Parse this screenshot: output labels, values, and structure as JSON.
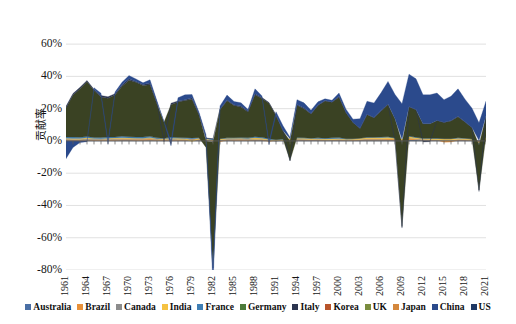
{
  "chart_data": {
    "type": "area",
    "stacked": true,
    "title": "",
    "subtitle": "",
    "xlabel": "",
    "ylabel": "贡献率",
    "ylim": [
      -80,
      70
    ],
    "ytick_labels": [
      "60%",
      "40%",
      "20%",
      "0%",
      "-20%",
      "-40%",
      "-60%",
      "-80%"
    ],
    "ytick_values": [
      60,
      40,
      20,
      0,
      -20,
      -40,
      -60,
      -80
    ],
    "xlim": [
      1961,
      2021
    ],
    "xtick_labels": [
      "1961",
      "1964",
      "1967",
      "1970",
      "1973",
      "1976",
      "1979",
      "1982",
      "1985",
      "1988",
      "1991",
      "1994",
      "1997",
      "2000",
      "2003",
      "2006",
      "2009",
      "2012",
      "2015",
      "2018",
      "2021"
    ],
    "xtick_values": [
      1961,
      1964,
      1967,
      1970,
      1973,
      1976,
      1979,
      1982,
      1985,
      1988,
      1991,
      1994,
      1997,
      2000,
      2003,
      2006,
      2009,
      2012,
      2015,
      2018,
      2021
    ],
    "grid": true,
    "grid_axis": "y",
    "legend_position": "bottom",
    "x": [
      1961,
      1962,
      1963,
      1964,
      1965,
      1966,
      1967,
      1968,
      1969,
      1970,
      1971,
      1972,
      1973,
      1974,
      1975,
      1976,
      1977,
      1978,
      1979,
      1980,
      1981,
      1982,
      1983,
      1984,
      1985,
      1986,
      1987,
      1988,
      1989,
      1990,
      1991,
      1992,
      1993,
      1994,
      1995,
      1996,
      1997,
      1998,
      1999,
      2000,
      2001,
      2002,
      2003,
      2004,
      2005,
      2006,
      2007,
      2008,
      2009,
      2010,
      2011,
      2012,
      2013,
      2014,
      2015,
      2016,
      2017,
      2018,
      2019,
      2020,
      2021
    ],
    "series": [
      {
        "name": "Australia",
        "color": "#4a6fa5",
        "values": [
          0.4,
          0.3,
          0.3,
          0.4,
          0.3,
          0.3,
          0.3,
          0.3,
          0.4,
          0.4,
          0.3,
          0.3,
          0.4,
          0.3,
          0.2,
          0.3,
          0.3,
          0.3,
          0.4,
          0.4,
          0.5,
          0.3,
          0.3,
          0.4,
          0.3,
          0.3,
          0.3,
          0.4,
          0.4,
          0.3,
          0.2,
          0.3,
          0.3,
          0.4,
          0.4,
          0.4,
          0.4,
          0.3,
          0.3,
          0.4,
          0.3,
          0.3,
          0.4,
          0.4,
          0.5,
          0.5,
          0.5,
          0.5,
          0.3,
          0.6,
          0.6,
          0.5,
          0.4,
          0.4,
          0.3,
          0.3,
          0.4,
          0.4,
          0.3,
          0.2,
          0.4
        ]
      },
      {
        "name": "Brazil",
        "color": "#e8913a",
        "values": [
          0.5,
          0.4,
          0.3,
          0.4,
          0.4,
          0.4,
          0.4,
          0.6,
          0.6,
          0.6,
          0.7,
          0.8,
          0.8,
          0.6,
          0.5,
          0.6,
          0.5,
          0.5,
          0.6,
          0.6,
          0.2,
          -0.3,
          -0.5,
          0.3,
          0.6,
          0.7,
          0.5,
          0.3,
          0.4,
          -0.4,
          0.2,
          0.1,
          0.4,
          0.5,
          0.4,
          0.3,
          0.3,
          0.1,
          0.1,
          0.3,
          0.2,
          0.3,
          0.3,
          0.6,
          0.5,
          0.5,
          0.7,
          0.7,
          -0.2,
          0.9,
          0.5,
          0.3,
          0.3,
          0.1,
          -0.8,
          -0.7,
          0.3,
          0.3,
          0.2,
          -0.6,
          0.7
        ]
      },
      {
        "name": "Canada",
        "color": "#8c8c8c",
        "values": [
          0.3,
          0.4,
          0.4,
          0.5,
          0.5,
          0.5,
          0.4,
          0.5,
          0.5,
          0.3,
          0.4,
          0.4,
          0.5,
          0.3,
          0.2,
          0.4,
          0.3,
          0.3,
          0.3,
          0.2,
          0.3,
          -0.5,
          0.3,
          0.5,
          0.4,
          0.3,
          0.4,
          0.4,
          0.3,
          0.1,
          -0.2,
          0.1,
          0.2,
          0.3,
          0.3,
          0.2,
          0.4,
          0.3,
          0.4,
          0.4,
          0.2,
          0.3,
          0.2,
          0.3,
          0.3,
          0.3,
          0.2,
          0.1,
          -0.4,
          0.3,
          0.3,
          0.2,
          0.2,
          0.2,
          0.1,
          0.1,
          0.3,
          0.2,
          0.1,
          -0.5,
          0.4
        ]
      },
      {
        "name": "India",
        "color": "#f5c242",
        "values": [
          0.5,
          0.4,
          0.5,
          0.6,
          0.3,
          0.2,
          0.6,
          0.4,
          0.5,
          0.5,
          0.3,
          0.2,
          0.4,
          0.2,
          0.6,
          0.4,
          0.5,
          0.4,
          -0.4,
          0.5,
          0.4,
          0.3,
          0.6,
          0.4,
          0.4,
          0.4,
          0.3,
          0.8,
          0.6,
          0.5,
          0.2,
          0.4,
          0.4,
          0.5,
          0.6,
          0.6,
          0.4,
          0.5,
          0.6,
          0.4,
          0.4,
          0.3,
          0.7,
          0.7,
          0.8,
          0.8,
          0.9,
          0.4,
          0.8,
          0.9,
          0.6,
          0.5,
          0.6,
          0.7,
          0.8,
          0.8,
          0.7,
          0.6,
          0.4,
          -0.6,
          0.9
        ]
      },
      {
        "name": "France",
        "color": "#3f7fb5",
        "values": [
          0.8,
          0.9,
          0.8,
          0.9,
          0.7,
          0.8,
          0.7,
          0.6,
          0.9,
          0.8,
          0.7,
          0.7,
          0.8,
          0.5,
          0.1,
          0.7,
          0.5,
          0.5,
          0.5,
          0.3,
          0.2,
          0.5,
          0.2,
          0.3,
          0.3,
          0.4,
          0.4,
          0.7,
          0.6,
          0.4,
          0.2,
          0.3,
          -0.1,
          0.4,
          0.3,
          0.2,
          0.4,
          0.5,
          0.5,
          0.6,
          0.3,
          0.2,
          0.1,
          0.3,
          0.2,
          0.3,
          0.3,
          0.1,
          -0.5,
          0.3,
          0.3,
          0.1,
          0.1,
          0.2,
          0.2,
          0.2,
          0.3,
          0.2,
          0.2,
          -0.8,
          0.6
        ]
      },
      {
        "name": "Germany",
        "color": "#3a4223",
        "values": [
          18,
          26,
          30,
          34,
          29,
          25,
          24,
          26,
          31,
          35,
          34,
          32,
          32,
          21,
          10,
          20,
          22,
          23,
          24,
          14,
          -4,
          -78,
          18,
          23,
          20,
          19,
          16,
          26,
          24,
          22,
          15,
          5,
          -12,
          20,
          18,
          15,
          20,
          23,
          22,
          25,
          16,
          10,
          6,
          14,
          12,
          16,
          20,
          12,
          -52,
          18,
          17,
          9,
          9,
          11,
          10,
          11,
          13,
          10,
          7,
          -28,
          12
        ]
      },
      {
        "name": "Italy",
        "color": "#2c3550",
        "values": [
          1.0,
          1.0,
          0.9,
          0.7,
          0.8,
          0.9,
          1.0,
          0.9,
          1.0,
          0.9,
          0.5,
          0.6,
          1.0,
          0.8,
          -0.5,
          1.0,
          0.7,
          0.6,
          1.0,
          0.8,
          0.3,
          0.2,
          0.3,
          0.5,
          0.5,
          0.5,
          0.6,
          0.7,
          0.6,
          0.5,
          0.3,
          0.2,
          -0.3,
          0.5,
          0.6,
          0.3,
          0.4,
          0.4,
          0.3,
          0.6,
          0.3,
          0.1,
          0.1,
          0.3,
          0.2,
          0.4,
          0.3,
          -0.2,
          -0.9,
          0.4,
          0.2,
          -0.6,
          -0.4,
          0.1,
          0.2,
          0.3,
          0.3,
          0.2,
          0.1,
          -0.9,
          0.6
        ]
      },
      {
        "name": "Korea",
        "color": "#b8542a"
      },
      {
        "name": "UK",
        "color": "#7a8c3e"
      },
      {
        "name": "Japan",
        "color": "#d4873c"
      },
      {
        "name": "China",
        "color": "#2b4a8c",
        "values": [
          -11,
          -4,
          -1,
          -0.5,
          1,
          1.5,
          -2,
          1,
          1.5,
          2,
          1.5,
          1,
          2,
          1,
          0.5,
          -3,
          2,
          3,
          2,
          1,
          2,
          -10,
          2,
          3,
          2,
          2,
          1,
          3,
          1,
          -2,
          2,
          3,
          1,
          3,
          3,
          2,
          2,
          1,
          1,
          2,
          2,
          2,
          6,
          8,
          9,
          11,
          14,
          15,
          22,
          20,
          19,
          18,
          18,
          17,
          14,
          15,
          17,
          14,
          12,
          11,
          9
        ]
      },
      {
        "name": "US",
        "color": "#1f3864"
      }
    ]
  },
  "legend": {
    "items": [
      {
        "label": "Australia",
        "color": "#4a6fa5"
      },
      {
        "label": "Brazil",
        "color": "#e8913a"
      },
      {
        "label": "Canada",
        "color": "#8c8c8c"
      },
      {
        "label": "India",
        "color": "#f5c242"
      },
      {
        "label": "France",
        "color": "#3f7fb5"
      },
      {
        "label": "Germany",
        "color": "#4b7a3a"
      },
      {
        "label": "Italy",
        "color": "#2c3550"
      },
      {
        "label": "Korea",
        "color": "#b8542a"
      },
      {
        "label": "UK",
        "color": "#7a8c3e"
      },
      {
        "label": "Japan",
        "color": "#d4873c"
      },
      {
        "label": "China",
        "color": "#2b4a8c"
      },
      {
        "label": "US",
        "color": "#1f3864"
      }
    ]
  },
  "axes": {
    "y_title": "贡献率"
  }
}
